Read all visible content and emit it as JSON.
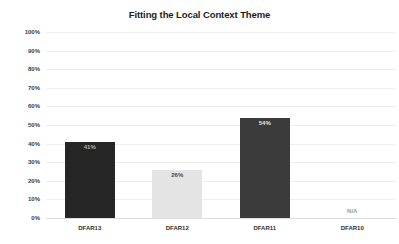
{
  "title": "Fitting the Local Context Theme",
  "colors": {
    "background": "#ffffff",
    "gridline": "#efefef",
    "baseline": "#dedede",
    "axis_text": "#3c3c3c",
    "category_text": "#2e2e2e",
    "title_text": "#1c1c1c"
  },
  "chart_data": {
    "type": "bar",
    "title": "Fitting the Local Context Theme",
    "categories": [
      "DFAR13",
      "DFAR12",
      "DFAR11",
      "DFAR10"
    ],
    "values": [
      41,
      26,
      54,
      null
    ],
    "value_labels": [
      "41%",
      "26%",
      "54%",
      "N/A"
    ],
    "bar_colors": [
      "#262626",
      "#e4e4e4",
      "#3b3b3b",
      null
    ],
    "bar_textures": [
      "stripe",
      "none",
      "fine",
      "none"
    ],
    "value_label_colors": [
      "#b4b4b4",
      "#4a4a4a",
      "#e6e6e6",
      "#9a9a9a"
    ],
    "xlabel": "",
    "ylabel": "",
    "y_ticks": [
      "100%",
      "90%",
      "80%",
      "70%",
      "60%",
      "50%",
      "40%",
      "30%",
      "20%",
      "10%",
      "0%"
    ],
    "ylim": [
      0,
      100
    ],
    "grid": true,
    "legend": false
  }
}
